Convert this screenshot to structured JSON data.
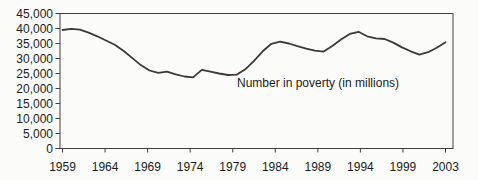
{
  "chart_data": {
    "type": "line",
    "title": "",
    "annotation": "Number in poverty (in millions)",
    "xlabel": "",
    "ylabel": "",
    "grid": false,
    "legend": "none",
    "ylim": [
      0,
      45000
    ],
    "y_tick_values": [
      0,
      5000,
      10000,
      15000,
      20000,
      25000,
      30000,
      35000,
      40000,
      45000
    ],
    "y_tick_labels": [
      "0",
      "5,000",
      "10,000",
      "15,000",
      "20,000",
      "25,000",
      "30,000",
      "35,000",
      "40,000",
      "45,000"
    ],
    "x_tick_labels": [
      "1959",
      "1964",
      "1969",
      "1974",
      "1979",
      "1984",
      "1989",
      "1994",
      "1999",
      "2003"
    ],
    "x": [
      1959,
      1960,
      1961,
      1962,
      1963,
      1964,
      1965,
      1966,
      1967,
      1968,
      1969,
      1970,
      1971,
      1972,
      1973,
      1974,
      1975,
      1976,
      1977,
      1978,
      1979,
      1980,
      1981,
      1982,
      1983,
      1984,
      1985,
      1986,
      1987,
      1988,
      1989,
      1990,
      1991,
      1992,
      1993,
      1994,
      1995,
      1996,
      1997,
      1998,
      1999,
      2000,
      2001,
      2002,
      2003
    ],
    "values": [
      39500,
      39900,
      39600,
      38600,
      37400,
      36000,
      34600,
      32600,
      30200,
      27800,
      26000,
      25200,
      25600,
      24700,
      24000,
      23700,
      26200,
      25600,
      25000,
      24500,
      24600,
      26400,
      29200,
      32400,
      34900,
      35600,
      35000,
      34100,
      33300,
      32600,
      32300,
      34200,
      36300,
      38200,
      38900,
      37400,
      36700,
      36500,
      35300,
      33700,
      32400,
      31300,
      32100,
      33600,
      35400
    ],
    "colors": {
      "background": "#fbfbfa",
      "text": "#1c1c1c",
      "axis": "#3f3f3f",
      "line": "#3a3a3a"
    }
  }
}
